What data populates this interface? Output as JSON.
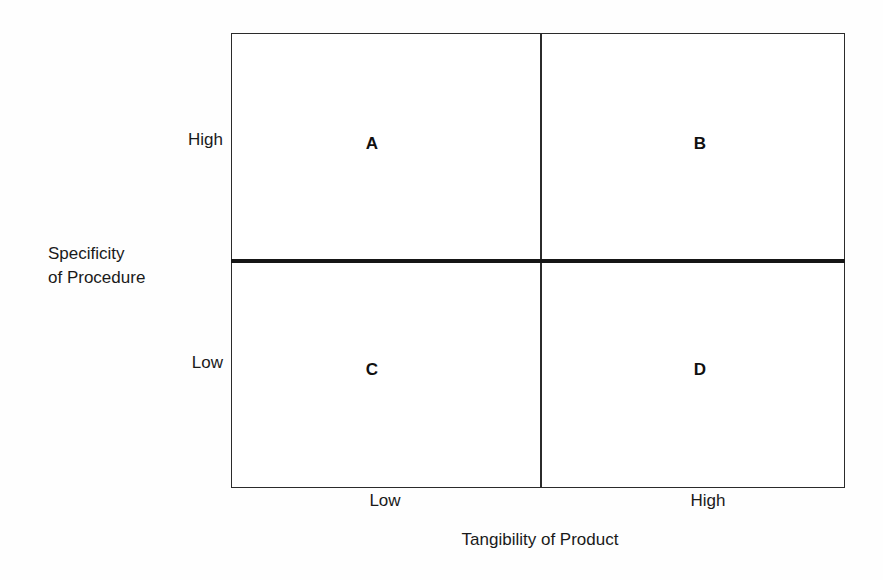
{
  "chart_data": {
    "type": "table",
    "title": "",
    "xlabel": "Tangibility of Product",
    "ylabel": "Specificity of Procedure",
    "x_tick_labels": [
      "Low",
      "High"
    ],
    "y_tick_labels": [
      "High",
      "Low"
    ],
    "grid": false,
    "legend": "none",
    "quadrants": [
      {
        "id": "A",
        "label": "A",
        "x": "Low",
        "y": "High"
      },
      {
        "id": "B",
        "label": "B",
        "x": "High",
        "y": "High"
      },
      {
        "id": "C",
        "label": "C",
        "x": "Low",
        "y": "Low"
      },
      {
        "id": "D",
        "label": "D",
        "x": "High",
        "y": "Low"
      }
    ]
  },
  "axes": {
    "y": {
      "title_line1": "Specificity",
      "title_line2": "of Procedure",
      "tick_high": "High",
      "tick_low": "Low"
    },
    "x": {
      "title": "Tangibility of Product",
      "tick_low": "Low",
      "tick_high": "High"
    }
  },
  "quadrant_labels": {
    "a": "A",
    "b": "B",
    "c": "C",
    "d": "D"
  },
  "colors": {
    "background": "#fefefe",
    "frame": "#2b2b2b",
    "divider_thick": "#161616",
    "text": "#1a1a1a"
  }
}
